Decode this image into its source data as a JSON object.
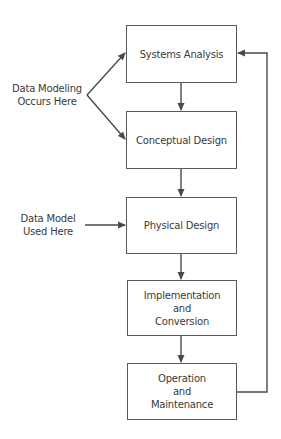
{
  "diagram": {
    "steps": [
      {
        "id": "systems-analysis",
        "lines": [
          "Systems Analysis"
        ]
      },
      {
        "id": "conceptual-design",
        "lines": [
          "Conceptual Design"
        ]
      },
      {
        "id": "physical-design",
        "lines": [
          "Physical Design"
        ]
      },
      {
        "id": "implementation-conversion",
        "lines": [
          "Implementation",
          "and",
          "Conversion"
        ]
      },
      {
        "id": "operation-maintenance",
        "lines": [
          "Operation",
          "and",
          "Maintenance"
        ]
      }
    ],
    "annotations": {
      "data_modeling": {
        "lines": [
          "Data Modeling",
          "Occurs Here"
        ]
      },
      "data_model_used": {
        "lines": [
          "Data Model",
          "Used Here"
        ]
      }
    },
    "colors": {
      "line": "#4a4a4a",
      "text": "#3a3a3a",
      "background": "#ffffff"
    }
  }
}
